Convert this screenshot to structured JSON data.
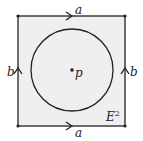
{
  "diagram": {
    "top_edge_label": "a",
    "bottom_edge_label": "a",
    "left_edge_label": "b",
    "right_edge_label": "b",
    "center_point_label": "p",
    "region_label": "E",
    "region_superscript": "2",
    "fill_color": "#efefef",
    "stroke_color": "#222222"
  }
}
